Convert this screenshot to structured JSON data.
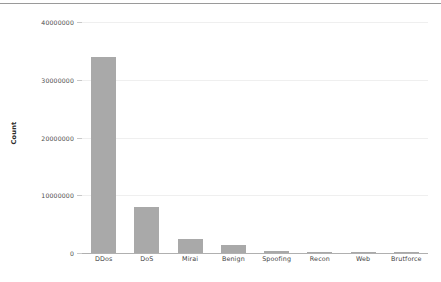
{
  "chart_data": {
    "type": "bar",
    "title": "",
    "xlabel": "",
    "ylabel": "Count",
    "categories": [
      "DDos",
      "DoS",
      "Mirai",
      "Benign",
      "Spoofing",
      "Recon",
      "Web",
      "Brutforce"
    ],
    "values": [
      34000000,
      8000000,
      2400000,
      1350000,
      350000,
      250000,
      60000,
      30000
    ],
    "ylim": [
      0,
      40000000
    ],
    "yticks": [
      0,
      10000000,
      20000000,
      30000000,
      40000000
    ],
    "ytick_labels": [
      "0",
      "10000000",
      "20000000",
      "30000000",
      "40000000"
    ],
    "grid": true,
    "legend": "none",
    "bar_color": "#a9a9a9",
    "background_color": "#ffffff",
    "axis_color": "#b0b0b0",
    "grid_color": "#efefef"
  },
  "axes": {
    "y_title": "Count"
  }
}
